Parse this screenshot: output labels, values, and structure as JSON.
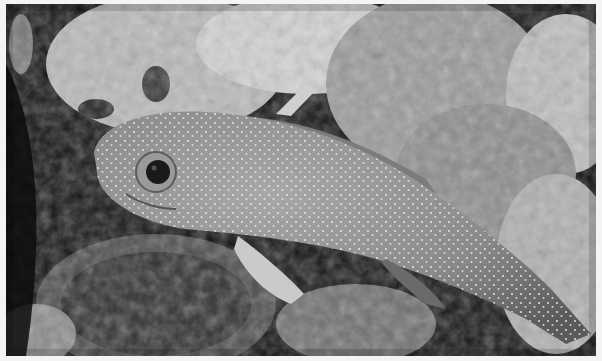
{
  "image": {
    "description": "Black-and-white underwater photograph of a white-spotted grouper resting among coral reef",
    "subject": "spotted grouper fish",
    "palette": {
      "background_dark": "#111111",
      "reef_light": "#c8c8c8",
      "reef_mid": "#7a7a7a",
      "fish_body": "#8e8e8e",
      "fish_spots": "#f0f0f0",
      "eye": "#1a1a1a",
      "border": "#f4f4f4"
    }
  }
}
